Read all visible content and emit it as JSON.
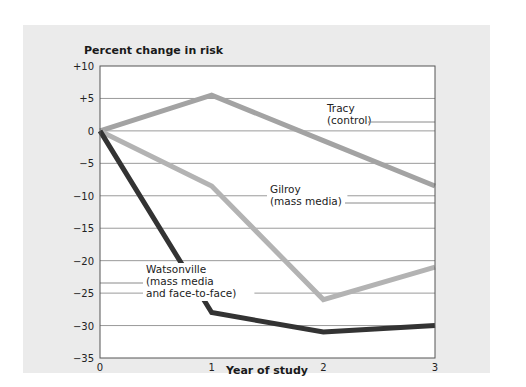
{
  "chart_data": {
    "type": "line",
    "title": "",
    "ylabel": "Percent change in risk",
    "xlabel": "Year of study",
    "x": [
      0,
      1,
      2,
      3
    ],
    "x_tick_labels": [
      "0",
      "1",
      "2",
      "3"
    ],
    "y_tick_labels": [
      "+10",
      "+5",
      "0",
      "-5",
      "-10",
      "-15",
      "-20",
      "-25",
      "-30",
      "-35"
    ],
    "ylim": [
      -35,
      10
    ],
    "xlim": [
      0,
      3
    ],
    "grid": "horizontal",
    "legend": "inline annotations",
    "series": [
      {
        "name": "Tracy (control)",
        "label_lines": [
          "Tracy",
          "(control)"
        ],
        "values": [
          0,
          5.5,
          -1.5,
          -8.5
        ],
        "color": "#a3a3a3"
      },
      {
        "name": "Gilroy (mass media)",
        "label_lines": [
          "Gilroy",
          "(mass media)"
        ],
        "values": [
          0,
          -8.5,
          -26,
          -21
        ],
        "color": "#b3b3b3"
      },
      {
        "name": "Watsonville (mass media and face-to-face)",
        "label_lines": [
          "Watsonville",
          "(mass media",
          "and face-to-face)"
        ],
        "values": [
          0,
          -28,
          -31,
          -30
        ],
        "color": "#333333"
      }
    ]
  },
  "colors": {
    "background_panel": "#ebebeb",
    "plot_area": "#ffffff",
    "gridline": "#9a9a9a",
    "axis": "#555555"
  }
}
